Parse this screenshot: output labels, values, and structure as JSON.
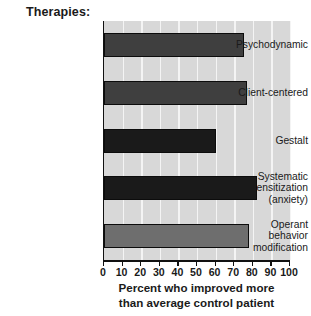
{
  "chart_data": {
    "type": "bar",
    "orientation": "horizontal",
    "title": "Therapies:",
    "xlabel_lines": [
      "Percent who improved more",
      "than average control patient"
    ],
    "xlabel": "Percent who improved more than average control patient",
    "ylabel": "",
    "categories": [
      "Psychodynamic",
      "Client-centered",
      "Gestalt",
      "Systematic desensitization (anxiety)",
      "Operant behavior modification"
    ],
    "category_label_lines": [
      [
        "Psychodynamic"
      ],
      [
        "Client-centered"
      ],
      [
        "Gestalt"
      ],
      [
        "Systematic",
        "desensitization",
        "(anxiety)"
      ],
      [
        "Operant",
        "behavior",
        "modification"
      ]
    ],
    "values": [
      75,
      77,
      60,
      82,
      78
    ],
    "bar_colors": [
      "#3f3f3f",
      "#3f3f3f",
      "#1a1a1a",
      "#1a1a1a",
      "#6e6e6e"
    ],
    "xlim": [
      0,
      100
    ],
    "xticks": [
      0,
      10,
      20,
      30,
      40,
      50,
      60,
      70,
      80,
      90,
      100
    ],
    "xtick_labels": [
      "0",
      "10",
      "20",
      "30",
      "40",
      "50",
      "60",
      "70",
      "80",
      "90",
      "100"
    ],
    "grid": "vertical-white",
    "legend": "none",
    "plot_background": "#d8d8d8",
    "axis_color": "#111111"
  }
}
